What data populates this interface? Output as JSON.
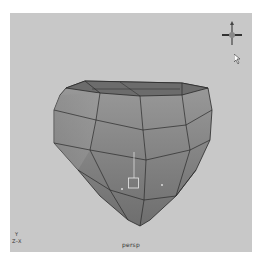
{
  "viewport": {
    "camera_label": "persp",
    "background_color": "#c8c8c8",
    "axis_gizmo": {
      "up_label": "Y",
      "horizontal_label": "Z–X"
    }
  },
  "view_cube": {
    "icon": "view-compass-icon"
  },
  "cursor": {
    "icon": "mouse-pointer-icon"
  },
  "mesh": {
    "type": "rounded polygon cube",
    "face_color": "#8a8a8a",
    "top_color": "#6a6a6a",
    "edge_color": "#2a2a2a",
    "pivot_icon": "pivot-manipulator-icon"
  }
}
